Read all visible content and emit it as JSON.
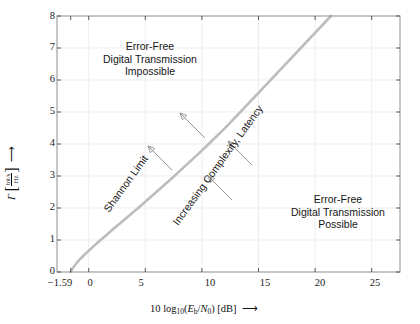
{
  "chart_data": {
    "type": "line",
    "title": "",
    "subtitle": "",
    "xlabel": "10 log10(Eb/N0) [dB]",
    "ylabel": "Γ [bit/s / Hz]",
    "xlim": [
      -2.8,
      27.5
    ],
    "ylim": [
      0,
      8
    ],
    "grid": true,
    "legend_position": "none",
    "x_ticks": [
      {
        "value": -1.59,
        "label": "−1.59"
      },
      {
        "value": 0,
        "label": "0"
      },
      {
        "value": 5,
        "label": "5"
      },
      {
        "value": 10,
        "label": "10"
      },
      {
        "value": 15,
        "label": "15"
      },
      {
        "value": 20,
        "label": "20"
      },
      {
        "value": 25,
        "label": "25"
      }
    ],
    "y_ticks": [
      {
        "value": 0,
        "label": "0"
      },
      {
        "value": 1,
        "label": "1"
      },
      {
        "value": 2,
        "label": "2"
      },
      {
        "value": 3,
        "label": "3"
      },
      {
        "value": 4,
        "label": "4"
      },
      {
        "value": 5,
        "label": "5"
      },
      {
        "value": 6,
        "label": "6"
      },
      {
        "value": 7,
        "label": "7"
      },
      {
        "value": 8,
        "label": "8"
      }
    ],
    "series": [
      {
        "name": "Shannon Limit",
        "color": "#bdbdbd",
        "line_width": 2.6,
        "x": [
          -1.5917,
          -1.45,
          -1.2,
          -0.85,
          -0.4,
          0.2,
          0.85,
          1.55,
          2.3,
          3.1,
          3.9,
          4.7,
          5.5,
          6.3,
          7.1,
          7.9,
          8.7,
          9.5,
          10.3,
          11.1,
          11.9,
          12.65,
          13.4,
          14.2,
          15.0
        ],
        "y": [
          0.0,
          0.1,
          0.22,
          0.37,
          0.53,
          0.73,
          0.94,
          1.15,
          1.38,
          1.62,
          1.86,
          2.1,
          2.35,
          2.6,
          2.85,
          3.11,
          3.37,
          3.63,
          3.9,
          4.17,
          4.45,
          4.72,
          5.0,
          5.3,
          5.6
        ]
      }
    ],
    "annotations": {
      "region_impossible": "Error-Free\nDigital Transmission\nImpossible",
      "region_impossible_lines": [
        "Error-Free",
        "Digital Transmission",
        "Impossible"
      ],
      "region_possible_lines": [
        "Error-Free",
        "Digital Transmission",
        "Possible"
      ],
      "curve_label": "Shannon Limit",
      "direction_label": "Increasing Complexity, Latency",
      "arrow_count": 4,
      "arrow_color": "#8c8c8c"
    }
  },
  "axis": {
    "x_title_prefix": "10 log",
    "x_title_sub": "10",
    "x_title_open": "(",
    "x_title_e": "E",
    "x_title_e_sub": "b",
    "x_title_slash": "/",
    "x_title_n": "N",
    "x_title_n_sub": "0",
    "x_title_close": ")",
    "x_title_units": "[dB]",
    "x_title_arrow": "⟶",
    "y_title_symbol": "Γ",
    "y_title_bracket_open": "[",
    "y_title_num": "bit/s",
    "y_title_den": "Hz",
    "y_title_bracket_close": "]",
    "y_title_arrow": "⟶"
  },
  "style": {
    "curve_color": "#bdbdbd",
    "grid_color": "#e9e9e9",
    "frame_color": "#8f8f8f",
    "text_color": "#161616",
    "arrow_color": "#8c8c8c",
    "background": "#ffffff"
  }
}
